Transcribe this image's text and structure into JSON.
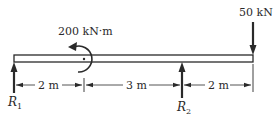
{
  "diagram": {
    "type": "beam-loading",
    "applied_moment": {
      "label": "200 kN·m",
      "value": 200,
      "unit": "kN·m",
      "direction": "counterclockwise"
    },
    "point_load": {
      "label": "50 kN",
      "value": 50,
      "unit": "kN",
      "direction": "down"
    },
    "reactions": [
      {
        "symbol": "R",
        "subscript": "1",
        "direction": "up"
      },
      {
        "symbol": "R",
        "subscript": "2",
        "direction": "up"
      }
    ],
    "dimensions": [
      {
        "label": "2 m",
        "length": 2
      },
      {
        "label": "3 m",
        "length": 3
      },
      {
        "label": "2 m",
        "length": 2
      }
    ],
    "colors": {
      "ink": "#2a2a2a",
      "background": "#ffffff"
    }
  }
}
